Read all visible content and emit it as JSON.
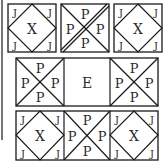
{
  "puzzle": {
    "row1": {
      "left": {
        "center": "X",
        "corners": [
          "J",
          "J",
          "J",
          "J"
        ]
      },
      "middle": {
        "letters": [
          "P",
          "P",
          "P",
          "P"
        ]
      },
      "right": {
        "center": "X",
        "corners": [
          "J",
          "J",
          "J",
          "J"
        ]
      }
    },
    "row2": {
      "left": {
        "letters": [
          "P",
          "P",
          "P",
          "P"
        ]
      },
      "middle": {
        "center": "E"
      },
      "right": {
        "letters": [
          "P",
          "P",
          "P",
          "P"
        ]
      }
    },
    "row3": {
      "left": {
        "center": "X",
        "corners": [
          "J",
          "J",
          "J",
          "J"
        ]
      },
      "middle": {
        "letters": [
          "P",
          "P",
          "P",
          "P"
        ]
      },
      "right": {
        "center": "X",
        "corners": [
          "J",
          "J",
          "J",
          "J"
        ]
      }
    }
  },
  "colors": {
    "line": "#1a1a1a",
    "text": "#2a2a2a",
    "background": "#ffffff"
  }
}
